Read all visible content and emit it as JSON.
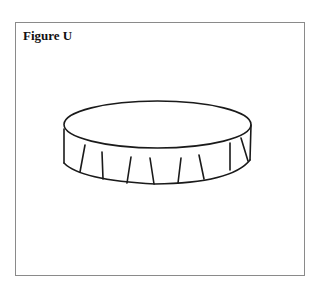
{
  "figure": {
    "title": "Figure U",
    "stroke_color": "#1a1a1a",
    "frame_color": "#8a8a8a"
  }
}
